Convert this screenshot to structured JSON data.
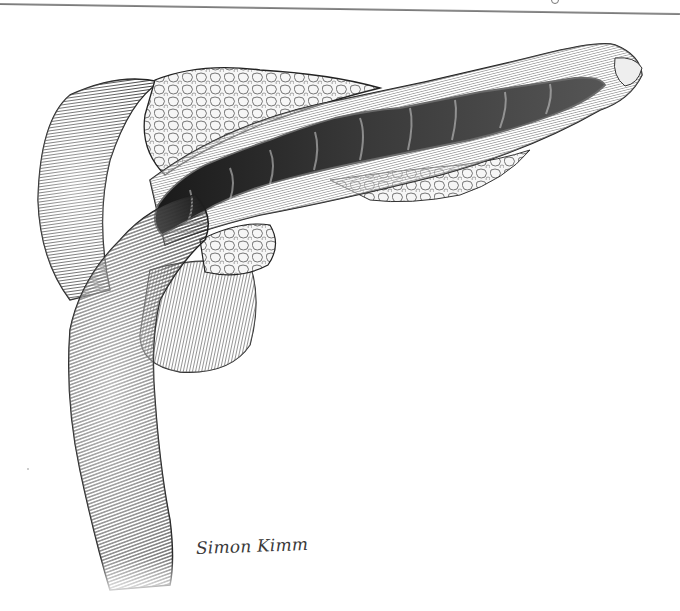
{
  "image": {
    "subject": "Pen-and-ink anatomical illustration of the pancreas with the main pancreatic duct opened lengthwise, duodenum curving below",
    "style": "black and white stipple / line hatching",
    "background_color": "#ffffff",
    "ink_color": "#1e1e1e"
  },
  "signature": {
    "text": "Simon Kimm"
  },
  "labels": {
    "pancreas_body": "pancreas",
    "duct": "opened pancreatic duct",
    "duodenum": "duodenum"
  }
}
